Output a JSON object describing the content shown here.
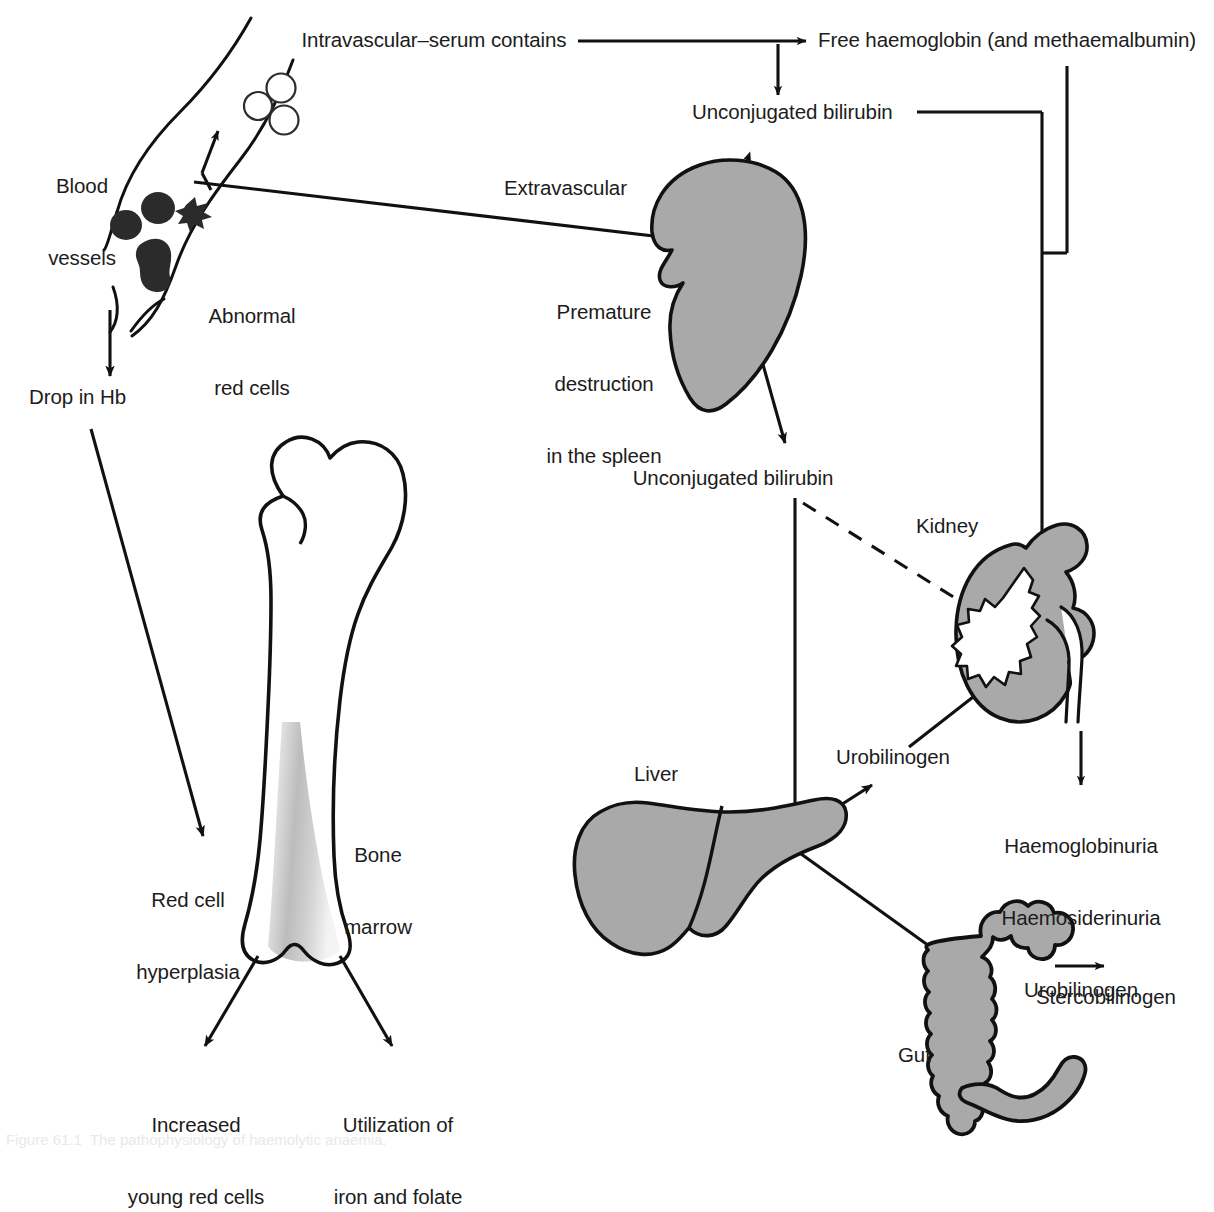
{
  "figure": {
    "domain": "diagram",
    "background_color": "#ffffff",
    "organ_fill_color": "#a9a9a9",
    "stroke_color": "#111111"
  },
  "labels": {
    "intravascular": "Intravascular–serum contains",
    "free_haemoglobin": "Free haemoglobin (and methaemalbumin)",
    "unconjugated_bilirubin_top": "Unconjugated bilirubin",
    "blood_vessels": "Blood\nvessels",
    "abnormal_red_cells": "Abnormal\nred cells",
    "extravascular": "Extravascular",
    "premature_destruction": "Premature\ndestruction\nin the spleen",
    "unconjugated_bilirubin_mid": "Unconjugated bilirubin",
    "drop_in_hb": "Drop in Hb",
    "kidney": "Kidney",
    "bone_marrow": "Bone\nmarrow",
    "red_cell_hyperplasia": "Red cell\nhyperplasia",
    "liver": "Liver",
    "urobilinogen": "Urobilinogen",
    "haemoglobinuria_block": "Haemoglobinuria\nHaemosiderinuria\nUrobilinogen",
    "gut": "Gut",
    "stercobilinogen": "Stercobilinogen",
    "increased_young_red_cells": "Increased\nyoung red cells",
    "utilization_iron_folate": "Utilization of\niron and folate"
  },
  "label_lines": {
    "blood_vessels": [
      "Blood",
      "vessels"
    ],
    "abnormal_red_cells": [
      "Abnormal",
      "red cells"
    ],
    "premature_destruction": [
      "Premature",
      "destruction",
      "in the spleen"
    ],
    "bone_marrow": [
      "Bone",
      "marrow"
    ],
    "red_cell_hyperplasia": [
      "Red cell",
      "hyperplasia"
    ],
    "haemoglobinuria_block": [
      "Haemoglobinuria",
      "Haemosiderinuria",
      "Urobilinogen"
    ],
    "increased_young_red_cells": [
      "Increased",
      "young red cells"
    ],
    "utilization_iron_folate": [
      "Utilization of",
      "iron and folate"
    ]
  },
  "organs": [
    {
      "name": "spleen",
      "label": "Premature destruction in the spleen"
    },
    {
      "name": "kidney",
      "label": "Kidney"
    },
    {
      "name": "liver",
      "label": "Liver"
    },
    {
      "name": "gut",
      "label": "Gut"
    },
    {
      "name": "femur",
      "label": "Bone marrow"
    }
  ],
  "cells": {
    "pale_red_cells_count": 3,
    "abnormal_red_cells_count": 4
  },
  "caption": {
    "text": "Figure 61.1  The pathophysiology of haemolytic anaemia."
  }
}
